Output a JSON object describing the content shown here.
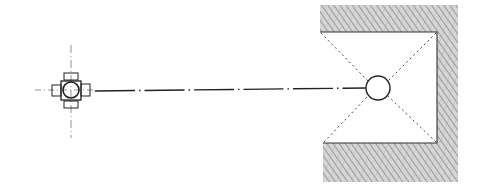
{
  "diagram": {
    "type": "technical-plan-drawing",
    "canvas": {
      "width": 484,
      "height": 192,
      "background": "#ffffff"
    },
    "colors": {
      "ink": "#222222",
      "hatch": "#8a8a8a",
      "hatch_fill": "#cfcfcf"
    },
    "left_symbol": {
      "name": "cross-shaped fixture (plan view)",
      "center": [
        71,
        90
      ],
      "square": {
        "x": 61,
        "y": 81,
        "w": 20,
        "h": 19
      },
      "circle_r": 8,
      "lugs": [
        {
          "side": "top",
          "x": 64,
          "y": 73,
          "w": 14,
          "h": 7
        },
        {
          "side": "bottom",
          "x": 64,
          "y": 101,
          "w": 14,
          "h": 7
        },
        {
          "side": "left",
          "x": 52,
          "y": 85,
          "w": 9,
          "h": 11
        },
        {
          "side": "right",
          "x": 81,
          "y": 84,
          "w": 9,
          "h": 12
        }
      ],
      "centerlines": {
        "vertical": [
          45,
          138
        ],
        "horizontal": [
          35,
          95
        ]
      }
    },
    "connector_line": {
      "style": "dash-dot",
      "from": [
        95,
        91
      ],
      "to": [
        366,
        88
      ]
    },
    "right_structure": {
      "name": "hatched U-shaped wall enclosure",
      "outer": {
        "x": 320,
        "y": 5,
        "w": 138,
        "h": 177
      },
      "cavity": {
        "x": 321,
        "y": 32,
        "w": 116,
        "h": 111
      },
      "circle": {
        "cx": 378,
        "cy": 88,
        "r": 12
      },
      "diagonals": "dotted lines from cavity corners to circle"
    }
  }
}
